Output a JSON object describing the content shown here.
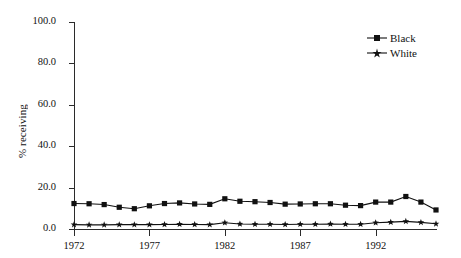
{
  "chart_data": {
    "type": "line",
    "title": "",
    "xlabel": "",
    "ylabel": "% receiving",
    "xlim": [
      1972,
      1996
    ],
    "ylim": [
      0,
      100
    ],
    "grid": false,
    "legend_position": "top-right",
    "xticks": [
      1972,
      1977,
      1982,
      1987,
      1992
    ],
    "xtick_labels": [
      "1972",
      "1977",
      "1982",
      "1987",
      "1992"
    ],
    "yticks": [
      0,
      20,
      40,
      60,
      80,
      100
    ],
    "ytick_labels": [
      "0.0",
      "20.0",
      "40.0",
      "60.0",
      "80.0",
      "100.0"
    ],
    "x": [
      1972,
      1973,
      1974,
      1975,
      1976,
      1977,
      1978,
      1979,
      1980,
      1981,
      1982,
      1983,
      1984,
      1985,
      1986,
      1987,
      1988,
      1989,
      1990,
      1991,
      1992,
      1993,
      1994,
      1995,
      1996
    ],
    "series": [
      {
        "name": "Black",
        "marker": "square",
        "color": "#111111",
        "values": [
          12.3,
          12.2,
          11.8,
          10.5,
          9.8,
          11.2,
          12.3,
          12.6,
          12.1,
          11.9,
          14.6,
          13.4,
          13.2,
          12.8,
          12.0,
          12.1,
          12.2,
          12.2,
          11.5,
          11.3,
          13.0,
          13.0,
          15.7,
          13.0,
          9.2
        ]
      },
      {
        "name": "White",
        "marker": "star",
        "color": "#111111",
        "values": [
          2.1,
          2.0,
          2.0,
          2.1,
          2.1,
          2.1,
          2.2,
          2.3,
          2.2,
          2.1,
          3.0,
          2.4,
          2.3,
          2.3,
          2.2,
          2.3,
          2.3,
          2.4,
          2.3,
          2.3,
          3.0,
          3.3,
          3.7,
          3.2,
          2.5
        ]
      }
    ]
  },
  "legend": {
    "entries": [
      {
        "label": "Black"
      },
      {
        "label": "White"
      }
    ]
  }
}
